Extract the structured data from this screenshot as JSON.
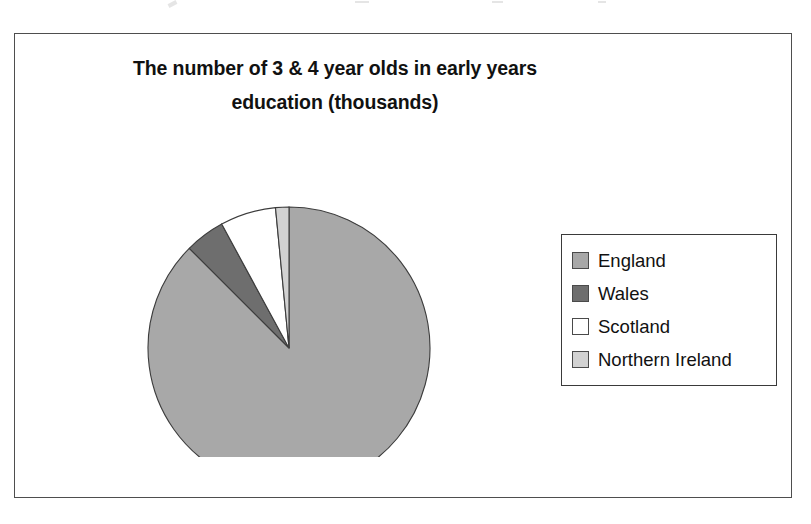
{
  "figure": {
    "title_line_1": "The number of 3 & 4 year olds in early years",
    "title_line_2": "education (thousands)"
  },
  "legend": {
    "position": "right",
    "items": [
      {
        "label": "England",
        "color": "#a8a8a8",
        "swatch_name": "legend-swatch-england"
      },
      {
        "label": "Wales",
        "color": "#6e6e6e",
        "swatch_name": "legend-swatch-wales"
      },
      {
        "label": "Scotland",
        "color": "#ffffff",
        "swatch_name": "legend-swatch-scotland"
      },
      {
        "label": "Northern Ireland",
        "color": "#d2d2d2",
        "swatch_name": "legend-swatch-northern-ireland"
      }
    ]
  },
  "chart_data": {
    "type": "pie",
    "title": "The number of 3 & 4 year olds in early years education (thousands)",
    "unit": "thousands",
    "categories": [
      "England",
      "Wales",
      "Scotland",
      "Northern Ireland"
    ],
    "values": [
      1150,
      60,
      85,
      20
    ],
    "percentages": [
      87.5,
      4.6,
      6.4,
      1.5
    ],
    "slice_angles_deg": [
      315,
      16.5,
      23,
      5.5
    ],
    "colors": [
      "#a8a8a8",
      "#6e6e6e",
      "#ffffff",
      "#d2d2d2"
    ],
    "start_angle_deg": 0,
    "direction": "clockwise",
    "data_labels": false,
    "grid": false,
    "legend_position": "right",
    "geometry": {
      "center_x": 142,
      "center_y": 175,
      "radius": 141
    }
  }
}
